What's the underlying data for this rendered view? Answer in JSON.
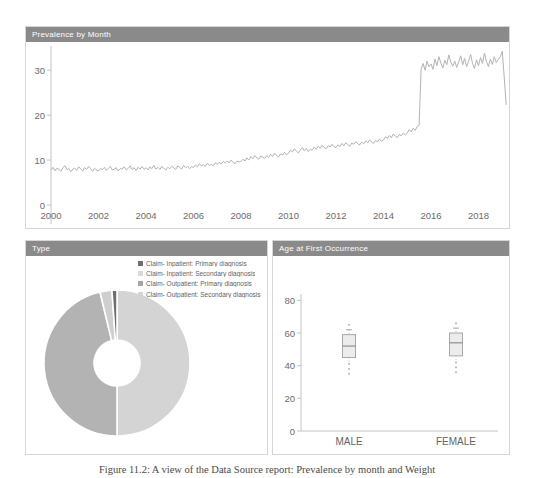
{
  "page": {
    "caption": "Figure 11.2: A view of the Data Source report: Prevalence by month and Weight"
  },
  "panels": {
    "prevalence": {
      "title": "Prevalence by Month"
    },
    "type": {
      "title": "Type"
    },
    "age": {
      "title": "Age at First Occurrence"
    }
  },
  "colors": {
    "header_bg": "#8a8a8a",
    "header_text": "#ffffff",
    "panel_border": "#d6d6d6",
    "axis_line": "#c4c4c4",
    "tick_text": "#6b6b6b",
    "series_line": "#b3b3b3",
    "box_fill": "#ececec",
    "box_stroke": "#a8a8a8",
    "median_stroke": "#8f8f8f"
  },
  "chart_data": [
    {
      "id": "prevalence",
      "type": "line",
      "title": "Prevalence by Month",
      "xlabel": "",
      "ylabel": "",
      "x_start_year": 2000,
      "x_step_months": 1,
      "x_ticks": [
        2000,
        2002,
        2004,
        2006,
        2008,
        2010,
        2012,
        2014,
        2016,
        2018
      ],
      "y_ticks": [
        0,
        10,
        20,
        30
      ],
      "ylim": [
        0,
        34.5
      ],
      "grid": false,
      "legend_position": "none",
      "series": [
        {
          "name": "prevalence-per-1000",
          "values": [
            7.8,
            8.4,
            7.6,
            8.2,
            8.0,
            7.5,
            8.3,
            8.7,
            7.9,
            8.1,
            7.4,
            8.0,
            8.2,
            7.7,
            8.5,
            8.0,
            7.6,
            8.3,
            7.9,
            8.6,
            8.1,
            7.5,
            8.2,
            7.8,
            7.6,
            8.1,
            7.9,
            8.4,
            7.7,
            8.2,
            8.6,
            7.8,
            8.0,
            8.3,
            7.6,
            8.1,
            8.0,
            8.5,
            7.8,
            8.2,
            8.7,
            7.9,
            8.3,
            7.7,
            8.4,
            8.0,
            8.6,
            7.9,
            8.3,
            7.8,
            8.5,
            8.1,
            8.8,
            8.0,
            8.4,
            7.9,
            8.6,
            8.2,
            7.8,
            8.4,
            8.1,
            8.6,
            8.3,
            7.9,
            8.7,
            8.4,
            8.0,
            8.8,
            8.3,
            8.6,
            8.1,
            8.5,
            8.4,
            8.9,
            8.5,
            9.2,
            8.7,
            9.0,
            8.6,
            9.3,
            8.8,
            9.1,
            8.7,
            9.4,
            9.0,
            9.5,
            9.1,
            9.7,
            9.3,
            9.8,
            9.4,
            10.0,
            9.5,
            9.2,
            9.8,
            9.6,
            9.7,
            10.2,
            9.8,
            10.5,
            10.0,
            10.8,
            10.3,
            11.0,
            10.5,
            10.2,
            10.9,
            10.6,
            10.4,
            11.0,
            10.6,
            11.3,
            10.8,
            11.5,
            11.0,
            10.7,
            11.4,
            11.1,
            11.7,
            11.2,
            11.5,
            12.2,
            11.8,
            12.5,
            12.0,
            11.6,
            12.3,
            12.8,
            12.1,
            12.6,
            11.9,
            12.4,
            12.2,
            12.9,
            12.4,
            13.1,
            12.6,
            13.3,
            12.8,
            12.5,
            13.2,
            12.9,
            13.5,
            13.0,
            12.8,
            13.4,
            13.0,
            13.7,
            13.2,
            13.9,
            13.4,
            13.1,
            13.8,
            13.5,
            14.1,
            13.6,
            13.4,
            14.0,
            13.6,
            14.3,
            13.8,
            14.5,
            14.0,
            13.7,
            14.4,
            14.1,
            14.7,
            14.2,
            14.5,
            15.2,
            14.8,
            15.5,
            15.0,
            15.8,
            15.3,
            15.0,
            15.7,
            15.4,
            16.0,
            15.6,
            16.0,
            16.8,
            16.3,
            17.1,
            16.6,
            17.4,
            17.8,
            30.2,
            31.5,
            30.0,
            32.0,
            30.8,
            31.4,
            30.2,
            32.5,
            31.0,
            33.0,
            31.6,
            30.5,
            32.2,
            31.2,
            33.4,
            31.8,
            30.9,
            32.0,
            30.6,
            31.8,
            33.2,
            31.2,
            32.6,
            30.8,
            32.0,
            33.5,
            31.5,
            30.4,
            32.3,
            31.0,
            32.8,
            31.5,
            33.8,
            32.0,
            30.8,
            32.5,
            31.3,
            33.0,
            31.7,
            32.4,
            33.0,
            34.2,
            28.5,
            22.3
          ]
        }
      ]
    },
    {
      "id": "type",
      "type": "pie",
      "donut": true,
      "title": "Type",
      "legend_position": "top-right",
      "slices": [
        {
          "label": "Claim- Outpatient: Secondary diagnosis",
          "value": 49.5,
          "color": "#d4d4d4"
        },
        {
          "label": "Claim- Outpatient: Primary diagnosis",
          "value": 45.8,
          "color": "#b3b3b3"
        },
        {
          "label": "Claim- Inpatient: Secondary diagnosis",
          "value": 2.6,
          "color": "#cfcfcf"
        },
        {
          "label": "Claim- Inpatient: Primary diagnosis",
          "value": 1.1,
          "color": "#6e6e6e"
        }
      ],
      "legend": [
        {
          "label": "Claim- Inpatient: Primary diagnosis",
          "color": "#6e6e6e"
        },
        {
          "label": "Claim- Inpatient: Secondary diagnosis",
          "color": "#d9d9d9"
        },
        {
          "label": "Claim- Outpatient: Primary diagnosis",
          "color": "#a6a6a6"
        },
        {
          "label": "Claim- Outpatient: Secondary diagnosis",
          "color": "#d4d4d4"
        }
      ]
    },
    {
      "id": "age",
      "type": "boxplot",
      "title": "Age at First Occurrence",
      "categories": [
        "MALE",
        "FEMALE"
      ],
      "y_ticks": [
        0,
        20,
        40,
        60,
        80
      ],
      "ylim": [
        0,
        90
      ],
      "boxes": [
        {
          "label": "MALE",
          "q1": 45,
          "median": 52,
          "q3": 59,
          "whisker_high": 62,
          "upper_points": [
            65
          ],
          "lower_points": [
            41,
            38,
            35
          ]
        },
        {
          "label": "FEMALE",
          "q1": 46,
          "median": 54,
          "q3": 60,
          "whisker_high": 63,
          "upper_points": [
            66
          ],
          "lower_points": [
            42,
            39,
            36
          ]
        }
      ]
    }
  ]
}
